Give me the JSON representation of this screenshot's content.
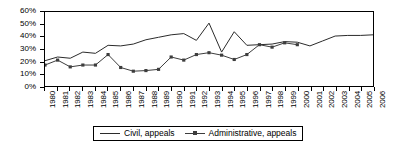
{
  "chart_data": {
    "type": "line",
    "title": "",
    "xlabel": "",
    "ylabel": "",
    "grid": false,
    "legend_position": "bottom",
    "ylim": [
      0,
      60
    ],
    "y_ticks": [
      0,
      10,
      20,
      30,
      40,
      50,
      60
    ],
    "y_tick_labels": [
      "0%",
      "10%",
      "20%",
      "30%",
      "40%",
      "50%",
      "60%"
    ],
    "categories": [
      "1980",
      "1981",
      "1982",
      "1983",
      "1984",
      "1985",
      "1986",
      "1987",
      "1988",
      "1989",
      "1990",
      "1991",
      "1992",
      "1993",
      "1994",
      "1995",
      "1996",
      "1997",
      "1998",
      "1999",
      "2000",
      "2001",
      "2002",
      "2003",
      "2004",
      "2005",
      "2006"
    ],
    "series": [
      {
        "name": "Civil, appeals",
        "marker": "none",
        "color": "#2b2b2b",
        "values": [
          20.5,
          23.5,
          22.5,
          27.5,
          26.5,
          33.0,
          32.5,
          34.0,
          37.5,
          39.5,
          41.5,
          42.5,
          37.0,
          51.0,
          27.5,
          44.0,
          33.0,
          33.5,
          34.0,
          36.0,
          35.5,
          32.5,
          36.5,
          40.5,
          41.0,
          41.0,
          41.5
        ]
      },
      {
        "name": "Administrative, appeals",
        "marker": "square",
        "color": "#3d3d3d",
        "values": [
          17.0,
          21.0,
          15.5,
          17.0,
          17.0,
          25.5,
          15.0,
          12.0,
          12.5,
          13.5,
          23.5,
          21.0,
          25.5,
          27.0,
          25.0,
          21.5,
          25.5,
          33.5,
          31.5,
          35.0,
          33.5,
          null,
          null,
          null,
          null,
          null,
          null
        ]
      }
    ]
  },
  "legend": {
    "entries": [
      {
        "label": "Civil, appeals"
      },
      {
        "label": "Administrative, appeals"
      }
    ]
  }
}
